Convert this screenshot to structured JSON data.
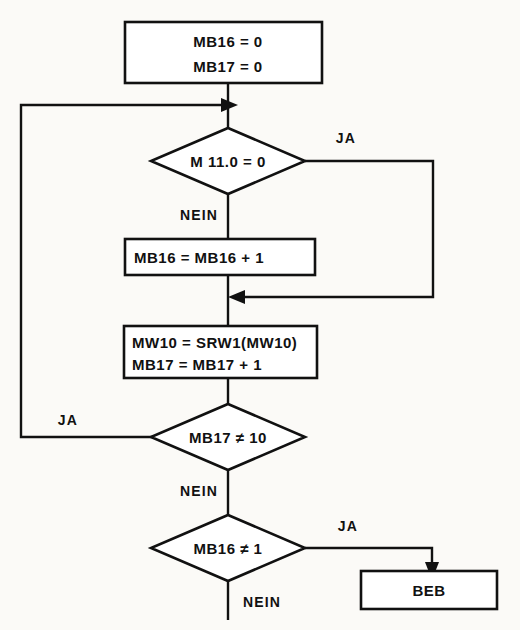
{
  "diagram": {
    "language": "de",
    "colors": {
      "background": "#fbfaf7",
      "stroke": "#111111",
      "shape_fill": "#ffffff"
    },
    "labels": {
      "yes": "JA",
      "no": "NEIN"
    },
    "nodes": {
      "init": {
        "type": "process",
        "line1": "MB16  =  0",
        "line2": "MB17  =  0"
      },
      "decision_m110": {
        "type": "decision",
        "text": "M 11.0 = 0"
      },
      "inc_mb16": {
        "type": "process",
        "text": "MB16  =  MB16 + 1"
      },
      "shift_block": {
        "type": "process",
        "line1": "MW10 = SRW1(MW10)",
        "line2": "MB17 = MB17 + 1"
      },
      "decision_mb17": {
        "type": "decision",
        "text": "MB17 ≠ 10"
      },
      "decision_mb16": {
        "type": "decision",
        "text": "MB16 ≠ 1"
      },
      "terminal_beb": {
        "type": "terminal",
        "text": "BEB"
      }
    },
    "branch_labels": {
      "m110_yes": "JA",
      "m110_no": "NEIN",
      "mb17_yes": "JA",
      "mb17_no": "NEIN",
      "mb16_yes": "JA",
      "mb16_no": "NEIN"
    }
  }
}
